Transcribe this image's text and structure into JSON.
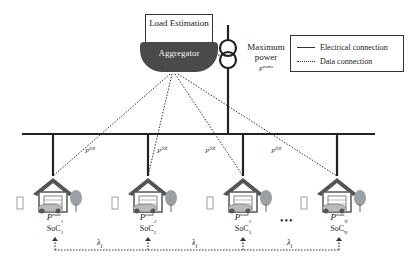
{
  "diagram": {
    "aggregator": {
      "load_estimation_label": "Load Estimation",
      "aggregator_label": "Aggregator"
    },
    "transformer": {
      "label_line1": "Maximum",
      "label_line2": "power",
      "symbol": "P",
      "symbol_sup": "trans"
    },
    "legend": {
      "items": [
        {
          "style": "solid",
          "label": "Electrical connection"
        },
        {
          "style": "dotted",
          "label": "Data connection"
        }
      ]
    },
    "feeder_labels": [
      "P",
      "P",
      "P",
      "P"
    ],
    "feeder_label_sup": "tot",
    "ev_stations": [
      {
        "p_label": "P",
        "p_sup": "max",
        "p_sub": "1",
        "soc_label": "SoC",
        "soc_sub": "1"
      },
      {
        "p_label": "P",
        "p_sup": "max",
        "p_sub": "2",
        "soc_label": "SoC",
        "soc_sub": "2"
      },
      {
        "p_label": "P",
        "p_sup": "max",
        "p_sub": "3",
        "soc_label": "SoC",
        "soc_sub": "3"
      },
      {
        "p_label": "P",
        "p_sup": "max",
        "p_sub": "N",
        "soc_label": "SoC",
        "soc_sub": "N"
      }
    ],
    "ellipsis": "•••",
    "lambda_labels": [
      "λ",
      "λ",
      "λ"
    ],
    "lambda_sub": "i",
    "colors": {
      "line": "#2b2b2b",
      "aggregator_fill": "#4a4a4a",
      "house_roof": "#555555",
      "tree": "#9aa0a6"
    }
  }
}
